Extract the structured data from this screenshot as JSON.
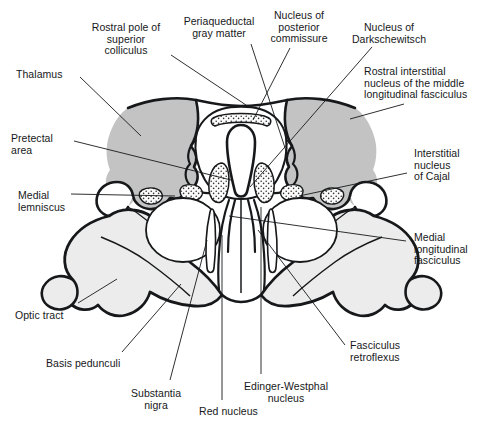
{
  "figure": {
    "kind": "anatomical-cross-section",
    "region": "rostral midbrain",
    "view": "transverse section",
    "background_color": "#ffffff",
    "ink_color": "#16181a",
    "fills": {
      "dark_gray": "#c3c3c3",
      "light_gray": "#ececec",
      "stipple_gray": "#d8d8d8",
      "white": "#ffffff"
    },
    "label_font_size_px": 10.5
  },
  "labels": [
    {
      "id": "rostral-pole-superior-colliculus",
      "text": "Rostral pole of\nsuperior\ncolliculus",
      "align": "center",
      "x": 126,
      "y": 22
    },
    {
      "id": "periaqueductal-gray-matter",
      "text": "Periaqueductal\ngray matter",
      "align": "center",
      "x": 219,
      "y": 16
    },
    {
      "id": "nucleus-of-posterior-commissure",
      "text": "Nucleus of\nposterior\ncommissure",
      "align": "center",
      "x": 299,
      "y": 10
    },
    {
      "id": "nucleus-of-darkschewitsch",
      "text": "Nucleus of\nDarkschewitsch",
      "align": "center",
      "x": 389,
      "y": 22
    },
    {
      "id": "rostral-interstitial-nucleus-mlf",
      "text": "Rostral interstitial\nnucleus of the middle\nlongitudinal fasciculus",
      "align": "left",
      "x": 364,
      "y": 66
    },
    {
      "id": "thalamus",
      "text": "Thalamus",
      "align": "left",
      "x": 16,
      "y": 69
    },
    {
      "id": "pretectal-area",
      "text": "Pretectal\narea",
      "align": "left",
      "x": 11,
      "y": 133
    },
    {
      "id": "medial-lemniscus",
      "text": "Medial\nlemniscus",
      "align": "left",
      "x": 18,
      "y": 190
    },
    {
      "id": "interstitial-nucleus-of-cajal",
      "text": "Interstitial\nnucleus\nof Cajal",
      "align": "left",
      "x": 414,
      "y": 148
    },
    {
      "id": "medial-longitudinal-fasciculus",
      "text": "Medial\nlongitudinal\nfasciculus",
      "align": "left",
      "x": 414,
      "y": 232
    },
    {
      "id": "optic-tract",
      "text": "Optic tract",
      "align": "left",
      "x": 15,
      "y": 310
    },
    {
      "id": "basis-pedunculi",
      "text": "Basis pedunculi",
      "align": "left",
      "x": 46,
      "y": 358
    },
    {
      "id": "substantia-nigra",
      "text": "Substantia\nnigra",
      "align": "center",
      "x": 156,
      "y": 388
    },
    {
      "id": "red-nucleus",
      "text": "Red nucleus",
      "align": "left",
      "x": 199,
      "y": 406
    },
    {
      "id": "edinger-westphal-nucleus",
      "text": "Edinger-Westphal\nnucleus",
      "align": "center",
      "x": 286,
      "y": 381
    },
    {
      "id": "fasciculus-retroflexus",
      "text": "Fasciculus\nretroflexus",
      "align": "left",
      "x": 350,
      "y": 340
    }
  ],
  "leaders": [
    {
      "id": "leader-rostral-pole-superior-colliculus",
      "d": "M171,55 L246,105"
    },
    {
      "id": "leader-periaqueductal-gray-matter",
      "d": "M251,44 L288,157"
    },
    {
      "id": "leader-nucleus-of-posterior-commissure",
      "d": "M290,48 L253,120"
    },
    {
      "id": "leader-nucleus-of-darkschewitsch",
      "d": "M372,47 L250,187"
    },
    {
      "id": "leader-rostral-interstitial-nucleus-mlf",
      "d": "M404,104 L350,119"
    },
    {
      "id": "leader-thalamus",
      "d": "M80,77 L141,136"
    },
    {
      "id": "leader-pretectal-area",
      "d": "M74,141 L231,180"
    },
    {
      "id": "leader-medial-lemniscus",
      "d": "M71,194 L175,196"
    },
    {
      "id": "leader-interstitial-nucleus-of-cajal",
      "d": "M407,173 L299,196"
    },
    {
      "id": "leader-medial-longitudinal-fasciculus",
      "d": "M406,241 L229,216"
    },
    {
      "id": "leader-optic-tract",
      "d": "M78,303 L117,279"
    },
    {
      "id": "leader-basis-pedunculi",
      "d": "M122,352 L181,284"
    },
    {
      "id": "leader-substantia-nigra",
      "d": "M170,380 L207,240"
    },
    {
      "id": "leader-red-nucleus",
      "d": "M222,400 L222,235"
    },
    {
      "id": "leader-edinger-westphal-nucleus",
      "d": "M261,374 L261,207"
    },
    {
      "id": "leader-fasciculus-retroflexus",
      "d": "M345,345 L258,230"
    }
  ]
}
